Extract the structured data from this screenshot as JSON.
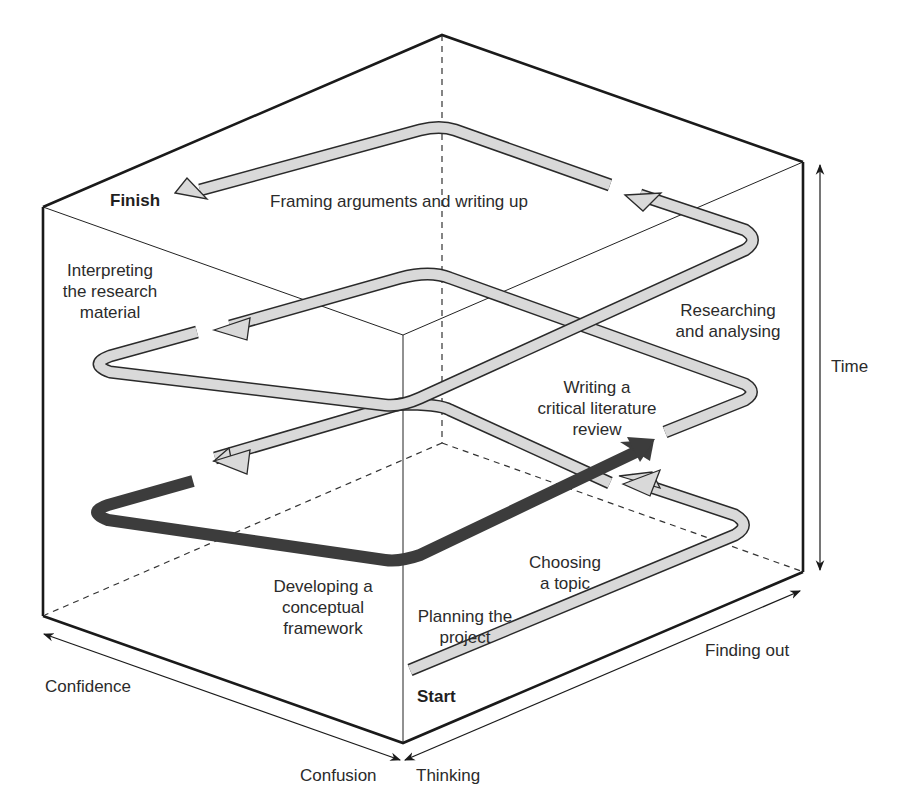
{
  "diagram": {
    "type": "3d-box-spiral-process",
    "colors": {
      "frame": "#1a1a1a",
      "path_fill": "#d9d9d9",
      "path_stroke": "#2a2a2a",
      "highlight_path": "#3c3c3c",
      "text": "#2b2b2b"
    },
    "markers": {
      "start": "Start",
      "finish": "Finish"
    },
    "stages": [
      {
        "id": "planning",
        "label": "Planning the project",
        "lines": [
          "Planning the",
          "project"
        ]
      },
      {
        "id": "choosing",
        "label": "Choosing a topic",
        "lines": [
          "Choosing",
          "a topic"
        ]
      },
      {
        "id": "literature",
        "label": "Writing a critical literature review",
        "lines": [
          "Writing a",
          "critical literature",
          "review"
        ]
      },
      {
        "id": "framework",
        "label": "Developing a conceptual framework",
        "lines": [
          "Developing a",
          "conceptual",
          "framework"
        ],
        "highlighted": true
      },
      {
        "id": "researching",
        "label": "Researching and analysing",
        "lines": [
          "Researching",
          "and analysing"
        ]
      },
      {
        "id": "interpreting",
        "label": "Interpreting the research material",
        "lines": [
          "Interpreting",
          "the research",
          "material"
        ]
      },
      {
        "id": "framing",
        "label": "Framing arguments and writing up",
        "lines": [
          "Framing arguments and writing up"
        ]
      }
    ],
    "axes": {
      "vertical": "Time",
      "left_diagonal_far": "Confidence",
      "left_diagonal_near": "Confusion",
      "right_diagonal_near": "Thinking",
      "right_diagonal_far": "Finding out"
    }
  }
}
